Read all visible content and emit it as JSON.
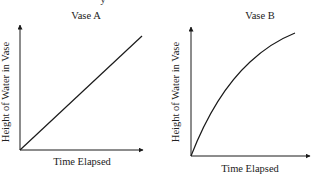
{
  "clipped_top_text": "y",
  "panels": [
    {
      "id": "vase-a",
      "title": "Vase A",
      "xlabel": "Time Elapsed",
      "ylabel": "Height of Water in Vase",
      "curve_type": "linear",
      "description": "Straight line from origin rising at constant rate"
    },
    {
      "id": "vase-b",
      "title": "Vase B",
      "xlabel": "Time Elapsed",
      "ylabel": "Height of Water in Vase",
      "curve_type": "concave-down",
      "description": "Curve from origin rising quickly at first, then more slowly"
    }
  ],
  "colors": {
    "stroke": "#1a1a1a",
    "text": "#222222",
    "background": "#ffffff"
  }
}
